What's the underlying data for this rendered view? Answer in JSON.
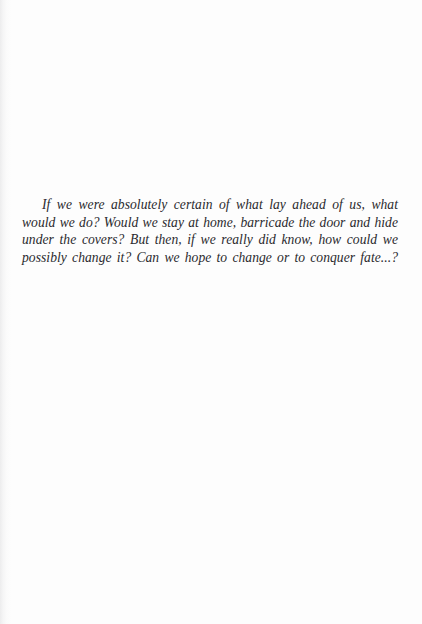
{
  "page": {
    "kind": "scanned-book-page",
    "background_color": "#fdfdfd",
    "text_color": "#2a2a2e",
    "width": 422,
    "height": 624
  },
  "body": {
    "epigraph": "If we were absolutely certain of what lay ahead of us, what would we do? Would we stay at home, barricade the door and hide under the covers? But then, if we really did know, how could we possibly change it? Can we hope to change or to conquer fate...?"
  }
}
